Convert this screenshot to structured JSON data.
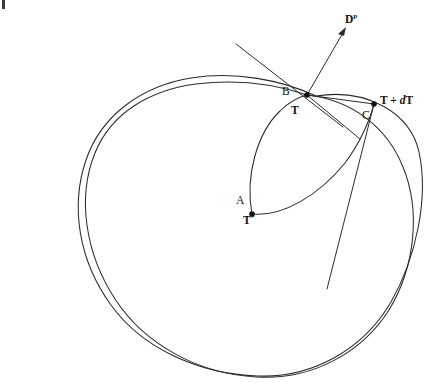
{
  "figure": {
    "background_color": "#ffffff",
    "stroke_color": "#2b2b2b",
    "width": 441,
    "height": 389
  },
  "labels": {
    "direction_vector": "D",
    "direction_vector_superscript": "p",
    "point_b": "B",
    "point_t": "T",
    "point_t_plus_dt_prefix": "T + ",
    "point_t_plus_dt_d": "d",
    "point_t_plus_dt_suffix": "T",
    "point_c": "C",
    "point_a": "A",
    "point_t_star": "T",
    "point_t_star_superscript": "*"
  },
  "geometry": {
    "vertices": [
      {
        "name": "T",
        "x": 307,
        "y": 95,
        "marked": true
      },
      {
        "name": "T+dT",
        "x": 374,
        "y": 104,
        "marked": true
      },
      {
        "name": "A",
        "x": 252,
        "y": 214,
        "marked": true
      }
    ],
    "outer_curve_1": "M 316 96 C 366 88 412 110 420 150 C 430 196 418 258 392 302 C 364 350 312 378 258 376 C 196 374 140 348 110 306 C 78 262 70 208 86 160 C 100 116 140 86 190 78 C 235 71 280 80 316 96 Z",
    "outer_curve_2": "M 307 95 C 352 100 388 128 404 168 C 422 212 416 268 390 310 C 362 354 312 380 258 377 C 200 374 146 346 116 300 C 86 254 78 198 96 154 C 112 114 150 90 196 84 C 236 79 275 84 307 95 Z",
    "inner_arc_left": "M 252 214 C 246 176 258 134 280 112 C 290 102 299 97 307 95",
    "inner_arc_right": "M 252 214 C 282 216 318 196 344 164 C 360 144 370 120 374 104",
    "rays_from_t": [
      {
        "name": "chord-T-to-TdT",
        "x1": 307,
        "y1": 95,
        "x2": 374,
        "y2": 104
      },
      {
        "name": "ray-T-lower-right",
        "x1": 307,
        "y1": 95,
        "x2": 360,
        "y2": 139
      },
      {
        "name": "tangent-line-B",
        "x1": 236,
        "y1": 44,
        "x2": 343,
        "y2": 127
      }
    ],
    "chord_TdT_down": {
      "x1": 374,
      "y1": 104,
      "x2": 326,
      "y2": 290
    },
    "arrow": {
      "name": "direction-vector-arrow",
      "x1": 307,
      "y1": 95,
      "x2": 346,
      "y2": 28,
      "head_size": 6
    },
    "artifact": {
      "x": 2,
      "y": 0,
      "w": 3,
      "h": 9
    }
  }
}
